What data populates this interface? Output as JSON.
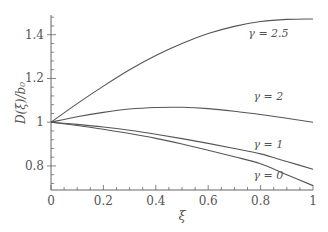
{
  "chart_data": {
    "type": "line",
    "title": "",
    "xlabel": "ξ",
    "ylabel": "D(ξ)/b₀",
    "xlim": [
      0,
      1
    ],
    "ylim": [
      0.69,
      1.49
    ],
    "grid": false,
    "x_ticks": [
      "0",
      "0.2",
      "0.4",
      "0.6",
      "0.8",
      "1"
    ],
    "y_ticks": [
      "0.8",
      "1",
      "1.2",
      "1.4"
    ],
    "x": [
      0,
      0.1,
      0.2,
      0.3,
      0.4,
      0.5,
      0.6,
      0.7,
      0.8,
      0.9,
      1.0
    ],
    "series": [
      {
        "name": "γ = 2.5",
        "label": "γ = 2.5",
        "values": [
          1.0,
          1.085,
          1.165,
          1.24,
          1.305,
          1.36,
          1.405,
          1.438,
          1.46,
          1.47,
          1.472
        ]
      },
      {
        "name": "γ = 2",
        "label": "γ = 2",
        "values": [
          1.0,
          1.025,
          1.045,
          1.06,
          1.067,
          1.068,
          1.062,
          1.05,
          1.035,
          1.018,
          1.0
        ]
      },
      {
        "name": "γ = 1",
        "label": "γ = 1",
        "values": [
          1.0,
          0.99,
          0.978,
          0.963,
          0.945,
          0.925,
          0.903,
          0.88,
          0.855,
          0.82,
          0.785
        ]
      },
      {
        "name": "γ = 0",
        "label": "γ = 0",
        "values": [
          1.0,
          0.985,
          0.968,
          0.948,
          0.926,
          0.9,
          0.872,
          0.842,
          0.81,
          0.76,
          0.71
        ]
      }
    ],
    "annotations": [
      {
        "text": "γ = 2.5",
        "x": 0.83,
        "y": 1.39
      },
      {
        "text": "γ = 2",
        "x": 0.83,
        "y": 1.1
      },
      {
        "text": "γ = 1",
        "x": 0.83,
        "y": 0.88
      },
      {
        "text": "γ = 0",
        "x": 0.83,
        "y": 0.74
      }
    ]
  }
}
